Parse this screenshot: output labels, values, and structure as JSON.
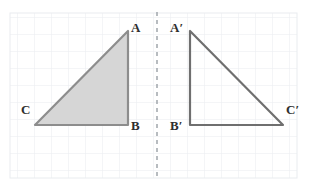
{
  "figure": {
    "background_color": "#ffffff",
    "grid": {
      "visible": true,
      "cell_size": 17,
      "line_color": "#e9ecef",
      "x_start": 10,
      "y_start": 13,
      "x_end": 297,
      "y_end": 178
    },
    "mirror_line": {
      "name": "line-of-reflection",
      "orientation": "vertical",
      "x": 157,
      "y_start": 12,
      "y_end": 180,
      "style": "dashed",
      "color": "#9aa0a6",
      "dash": "4 4",
      "width": 1.4
    },
    "shapes": [
      {
        "id": "triangle-preimage",
        "label": "pre-image",
        "fill": "#d6d6d6",
        "stroke": "#8d8d8d",
        "stroke_width": 2.2,
        "vertices": [
          {
            "name": "A",
            "x": 128,
            "y": 31
          },
          {
            "name": "B",
            "x": 128,
            "y": 125
          },
          {
            "name": "C",
            "x": 35,
            "y": 125
          }
        ]
      },
      {
        "id": "triangle-image",
        "label": "image",
        "fill": "none",
        "stroke": "#6f6f6f",
        "stroke_width": 2.2,
        "vertices": [
          {
            "name": "A'",
            "x": 190,
            "y": 31
          },
          {
            "name": "B'",
            "x": 190,
            "y": 125
          },
          {
            "name": "C'",
            "x": 283,
            "y": 125
          }
        ]
      }
    ],
    "labels": [
      {
        "id": "label-a",
        "text": "A",
        "x": 131,
        "y": 21,
        "color": "#2e2e2e"
      },
      {
        "id": "label-b",
        "text": "B",
        "x": 131,
        "y": 119,
        "color": "#2e2e2e"
      },
      {
        "id": "label-c",
        "text": "C",
        "x": 21,
        "y": 103,
        "color": "#2e2e2e"
      },
      {
        "id": "label-a-prime",
        "text": "A′",
        "x": 170,
        "y": 21,
        "color": "#2e2e2e"
      },
      {
        "id": "label-b-prime",
        "text": "B′",
        "x": 170,
        "y": 119,
        "color": "#2e2e2e"
      },
      {
        "id": "label-c-prime",
        "text": "C′",
        "x": 286,
        "y": 103,
        "color": "#2e2e2e"
      }
    ]
  }
}
